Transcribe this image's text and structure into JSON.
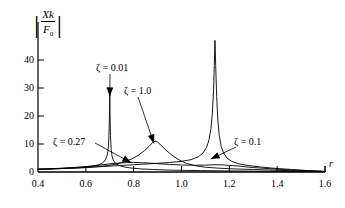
{
  "chart_data": {
    "type": "line",
    "title": "",
    "xlabel": "r",
    "ylabel_text": "|Xk/F0|",
    "ylabel_numerator": "Xk",
    "ylabel_denominator_base": "F",
    "ylabel_denominator_sub": "0",
    "xlim": [
      0.4,
      1.6
    ],
    "ylim": [
      0,
      47
    ],
    "xticks": [
      0.4,
      0.6,
      0.8,
      1.0,
      1.2,
      1.4,
      1.6
    ],
    "xtick_labels": [
      "0.4",
      "0.6",
      "0.8",
      "1.0",
      "1.2",
      "1.4",
      "1.6"
    ],
    "yticks": [
      0,
      10,
      20,
      30,
      40
    ],
    "ytick_labels": [
      "0",
      "10",
      "20",
      "30",
      "40"
    ],
    "grid": false,
    "legend": "annotations",
    "series": [
      {
        "name": "zeta = 0.01",
        "label": "ζ = 0.01",
        "peak_r": 0.7,
        "peak_value": 29.0,
        "points": [
          [
            0.4,
            1.0
          ],
          [
            0.45,
            1.1
          ],
          [
            0.5,
            1.3
          ],
          [
            0.55,
            1.5
          ],
          [
            0.58,
            1.7
          ],
          [
            0.61,
            1.9
          ],
          [
            0.63,
            2.1
          ],
          [
            0.65,
            2.5
          ],
          [
            0.665,
            3.0
          ],
          [
            0.675,
            3.6
          ],
          [
            0.682,
            4.4
          ],
          [
            0.688,
            5.6
          ],
          [
            0.692,
            7.2
          ],
          [
            0.695,
            10.0
          ],
          [
            0.697,
            14.0
          ],
          [
            0.699,
            21.0
          ],
          [
            0.7,
            29.0
          ],
          [
            0.701,
            21.0
          ],
          [
            0.703,
            13.0
          ],
          [
            0.706,
            8.0
          ],
          [
            0.71,
            5.5
          ],
          [
            0.716,
            4.0
          ],
          [
            0.725,
            3.0
          ],
          [
            0.74,
            2.3
          ],
          [
            0.76,
            1.8
          ],
          [
            0.79,
            1.4
          ],
          [
            0.83,
            1.1
          ],
          [
            0.88,
            0.9
          ],
          [
            0.94,
            0.7
          ],
          [
            1.0,
            0.6
          ],
          [
            1.08,
            0.5
          ],
          [
            1.18,
            0.4
          ],
          [
            1.3,
            0.3
          ],
          [
            1.45,
            0.2
          ],
          [
            1.6,
            0.15
          ]
        ]
      },
      {
        "name": "zeta = 0.27",
        "label": "ζ = 0.27",
        "peak_r": 0.8,
        "peak_value": 3.4,
        "points": [
          [
            0.4,
            1.0
          ],
          [
            0.45,
            1.15
          ],
          [
            0.5,
            1.35
          ],
          [
            0.55,
            1.6
          ],
          [
            0.6,
            1.95
          ],
          [
            0.64,
            2.3
          ],
          [
            0.68,
            2.7
          ],
          [
            0.71,
            3.0
          ],
          [
            0.74,
            3.2
          ],
          [
            0.77,
            3.35
          ],
          [
            0.8,
            3.4
          ],
          [
            0.83,
            3.35
          ],
          [
            0.86,
            3.2
          ],
          [
            0.9,
            3.0
          ],
          [
            0.95,
            2.7
          ],
          [
            1.0,
            2.5
          ],
          [
            1.05,
            2.4
          ],
          [
            1.1,
            2.45
          ],
          [
            1.14,
            2.6
          ],
          [
            1.18,
            2.5
          ],
          [
            1.24,
            2.1
          ],
          [
            1.3,
            1.6
          ],
          [
            1.38,
            1.1
          ],
          [
            1.46,
            0.7
          ],
          [
            1.53,
            0.4
          ],
          [
            1.6,
            0.2
          ]
        ]
      },
      {
        "name": "zeta = 1.0",
        "label": "ζ = 1.0",
        "peak_r": 0.89,
        "peak_value": 11.0,
        "points": [
          [
            0.4,
            1.0
          ],
          [
            0.46,
            1.1
          ],
          [
            0.52,
            1.3
          ],
          [
            0.58,
            1.5
          ],
          [
            0.63,
            1.8
          ],
          [
            0.68,
            2.2
          ],
          [
            0.72,
            2.7
          ],
          [
            0.76,
            3.6
          ],
          [
            0.79,
            4.6
          ],
          [
            0.82,
            6.0
          ],
          [
            0.845,
            7.6
          ],
          [
            0.865,
            9.2
          ],
          [
            0.88,
            10.6
          ],
          [
            0.89,
            11.0
          ],
          [
            0.9,
            10.7
          ],
          [
            0.915,
            9.5
          ],
          [
            0.935,
            7.8
          ],
          [
            0.96,
            6.0
          ],
          [
            0.99,
            4.3
          ],
          [
            1.02,
            3.1
          ],
          [
            1.06,
            2.2
          ],
          [
            1.1,
            1.7
          ],
          [
            1.15,
            1.4
          ],
          [
            1.22,
            1.1
          ],
          [
            1.3,
            0.9
          ],
          [
            1.4,
            0.6
          ],
          [
            1.5,
            0.4
          ],
          [
            1.6,
            0.2
          ]
        ]
      },
      {
        "name": "zeta = 0.1",
        "label": "ζ = 0.1",
        "peak_r": 1.14,
        "peak_value": 47.0,
        "points": [
          [
            0.4,
            1.0
          ],
          [
            0.47,
            1.15
          ],
          [
            0.54,
            1.35
          ],
          [
            0.6,
            1.6
          ],
          [
            0.66,
            1.9
          ],
          [
            0.72,
            2.2
          ],
          [
            0.78,
            2.5
          ],
          [
            0.84,
            2.8
          ],
          [
            0.9,
            3.1
          ],
          [
            0.95,
            3.4
          ],
          [
            1.0,
            3.8
          ],
          [
            1.04,
            4.4
          ],
          [
            1.07,
            5.4
          ],
          [
            1.09,
            6.8
          ],
          [
            1.105,
            8.8
          ],
          [
            1.115,
            11.5
          ],
          [
            1.123,
            15.5
          ],
          [
            1.129,
            21.0
          ],
          [
            1.134,
            29.0
          ],
          [
            1.137,
            38.0
          ],
          [
            1.14,
            47.0
          ],
          [
            1.143,
            38.0
          ],
          [
            1.147,
            27.0
          ],
          [
            1.152,
            18.5
          ],
          [
            1.158,
            13.0
          ],
          [
            1.166,
            9.2
          ],
          [
            1.176,
            6.8
          ],
          [
            1.19,
            5.0
          ],
          [
            1.21,
            3.8
          ],
          [
            1.24,
            2.9
          ],
          [
            1.28,
            2.3
          ],
          [
            1.33,
            1.8
          ],
          [
            1.39,
            1.3
          ],
          [
            1.46,
            0.9
          ],
          [
            1.53,
            0.5
          ],
          [
            1.6,
            0.2
          ]
        ]
      }
    ],
    "annotations": [
      {
        "name": "zeta-001-label",
        "label": "ζ = 0.01",
        "x_px": 96,
        "y_px": 62,
        "target_r": 0.7,
        "target_value": 27.0
      },
      {
        "name": "zeta-10-label",
        "label": "ζ = 1.0",
        "x_px": 124,
        "y_px": 85,
        "target_r": 0.885,
        "target_value": 10.2
      },
      {
        "name": "zeta-027-label",
        "label": "ζ = 0.27",
        "x_px": 53,
        "y_px": 136,
        "target_r": 0.79,
        "target_value": 3.3
      },
      {
        "name": "zeta-01-label",
        "label": "ζ = 0.1",
        "x_px": 234,
        "y_px": 136,
        "target_r": 1.122,
        "target_value": 4.6
      }
    ]
  }
}
